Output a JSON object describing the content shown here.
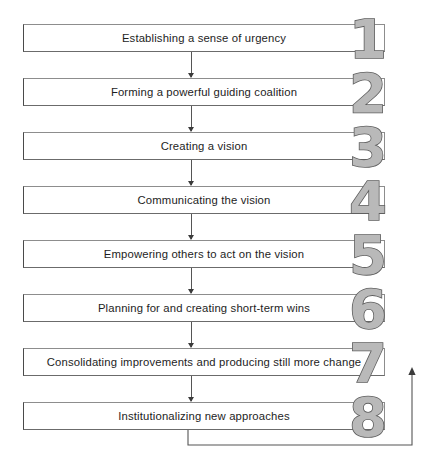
{
  "diagram": {
    "type": "vertical-flowchart",
    "background_color": "#ffffff",
    "box_border_color": "#4a4a4a",
    "numeral_fill_color": "#b9b9b9",
    "numeral_outline_color": "#5e5e5e",
    "connector_color": "#555555",
    "steps": [
      {
        "number": "1",
        "label": "Establishing a sense of urgency"
      },
      {
        "number": "2",
        "label": "Forming a powerful guiding coalition"
      },
      {
        "number": "3",
        "label": "Creating a vision"
      },
      {
        "number": "4",
        "label": "Communicating the vision"
      },
      {
        "number": "5",
        "label": "Empowering others to act on the vision"
      },
      {
        "number": "6",
        "label": "Planning for and creating short-term wins"
      },
      {
        "number": "7",
        "label": "Consolidating improvements and producing still more change"
      },
      {
        "number": "8",
        "label": "Institutionalizing new approaches"
      }
    ],
    "feedback_loop": {
      "from_step": "8",
      "to_step": "7",
      "direction": "upward",
      "has_arrowhead": true
    }
  }
}
